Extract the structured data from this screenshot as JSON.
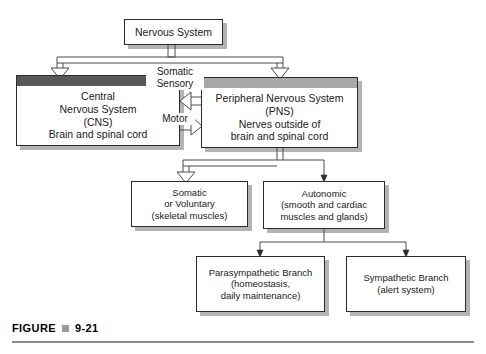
{
  "figure": {
    "label": "FIGURE",
    "bullet_icon": "square-bullet-icon",
    "number": "9-21"
  },
  "colors": {
    "background": "#ffffff",
    "box_border": "#2b2b2b",
    "box_fill": "#ffffff",
    "cns_header": "#585858",
    "pns_header": "#a8a8a8",
    "shadow": "#b3b3b3",
    "connector": "#4a4a4a",
    "caption_rule": "#8d8d8d",
    "caption_bullet": "#9a9a9a"
  },
  "diagram": {
    "nodes": {
      "nervous_system": {
        "label": "Nervous System",
        "header": "none"
      },
      "cns": {
        "label": "Central\nNervous System\n(CNS)\nBrain and spinal cord",
        "header": "dark-gray"
      },
      "pns": {
        "label": "Peripheral Nervous System\n(PNS)\nNerves outside of\nbrain and spinal cord",
        "header": "light-gray"
      },
      "somatic": {
        "label": "Somatic\nor Voluntary\n(skeletal muscles)",
        "header": "none"
      },
      "autonomic": {
        "label": "Autonomic\n(smooth and cardiac\nmuscles and glands)",
        "header": "none"
      },
      "parasympathetic": {
        "label": "Parasympathetic Branch\n(homeostasis,\ndaily maintenance)",
        "header": "none"
      },
      "sympathetic": {
        "label": "Sympathetic Branch\n(alert system)",
        "header": "none"
      }
    },
    "edge_labels": {
      "somatic_sensory": "Somatic\nSensory",
      "motor": "Motor"
    },
    "edges": [
      {
        "from": "nervous_system",
        "to": "cns",
        "arrow": "hollow-down"
      },
      {
        "from": "nervous_system",
        "to": "pns",
        "arrow": "hollow-down"
      },
      {
        "from": "pns",
        "to": "cns",
        "arrow": "hollow-left",
        "label": "Somatic Sensory"
      },
      {
        "from": "cns",
        "to": "pns",
        "arrow": "hollow-right",
        "label": "Motor"
      },
      {
        "from": "pns",
        "to": "somatic",
        "arrow": "hollow-down"
      },
      {
        "from": "pns",
        "to": "autonomic",
        "arrow": "solid-down"
      },
      {
        "from": "autonomic",
        "to": "parasympathetic",
        "arrow": "solid-down"
      },
      {
        "from": "autonomic",
        "to": "sympathetic",
        "arrow": "solid-down"
      }
    ]
  }
}
